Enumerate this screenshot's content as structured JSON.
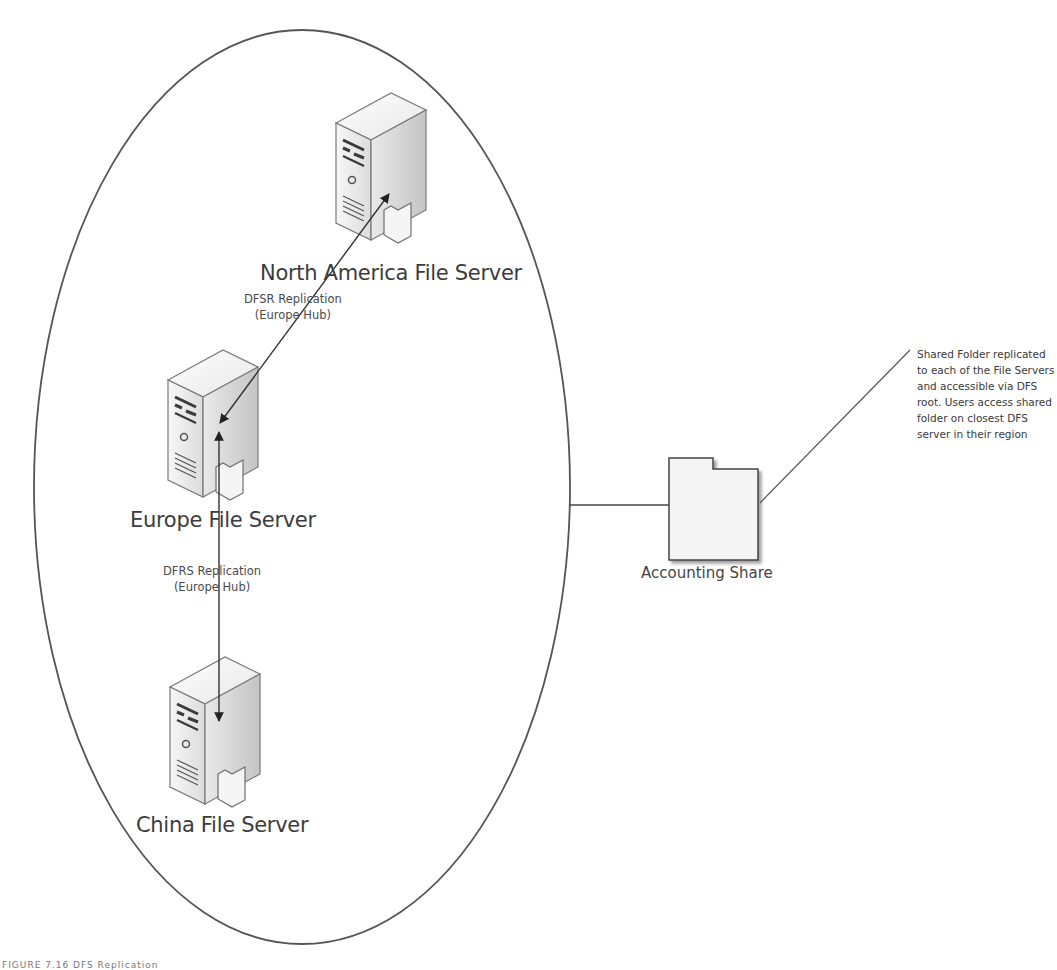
{
  "diagram": {
    "servers": [
      {
        "id": "na",
        "label": "North America File Server"
      },
      {
        "id": "eu",
        "label": "Europe File Server"
      },
      {
        "id": "cn",
        "label": "China File Server"
      }
    ],
    "replication_links": [
      {
        "from": "eu",
        "to": "na",
        "line1": "DFSR Replication",
        "line2": "(Europe Hub)"
      },
      {
        "from": "eu",
        "to": "cn",
        "line1": "DFRS Replication",
        "line2": "(Europe Hub)"
      }
    ],
    "share": {
      "label": "Accounting Share",
      "icon": "folder-icon"
    },
    "annotation": {
      "text": "Shared Folder replicated to each of the File Servers and accessible via DFS root. Users access shared folder on closest DFS server in their region"
    },
    "caption": "FIGURE 7.16 DFS Replication",
    "colors": {
      "line": "#4a4a4a",
      "server_light": "#f2f2f2",
      "server_dark": "#bdbdbd",
      "folder_fill": "#f4f4f4"
    }
  }
}
